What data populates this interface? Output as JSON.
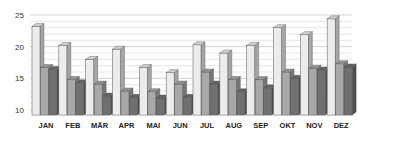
{
  "chart_data": {
    "type": "bar",
    "style": "3d-clustered-column",
    "title": "",
    "xlabel": "",
    "ylabel": "",
    "ylim": [
      9.2,
      25.5
    ],
    "yticks": [
      10,
      15,
      20,
      25
    ],
    "grid": true,
    "minor_grid_step": 1,
    "legend": null,
    "categories": [
      "JAN",
      "FEB",
      "MÄR",
      "APR",
      "MAI",
      "JUN",
      "JUL",
      "AUG",
      "SEP",
      "OKT",
      "NOV",
      "DEZ"
    ],
    "series": [
      {
        "name": "Series 1",
        "color": "#ececec",
        "values": [
          23.2,
          20.2,
          18.0,
          19.6,
          16.7,
          15.9,
          20.3,
          19.0,
          20.2,
          23.0,
          21.9,
          24.4
        ]
      },
      {
        "name": "Series 2",
        "color": "#a8a8a8",
        "values": [
          16.7,
          14.8,
          14.1,
          13.0,
          12.9,
          14.1,
          16.0,
          14.8,
          14.8,
          16.0,
          16.6,
          17.3
        ]
      },
      {
        "name": "Series 3",
        "color": "#707070",
        "values": [
          16.4,
          14.3,
          12.2,
          12.0,
          11.9,
          12.0,
          14.1,
          12.9,
          13.5,
          15.0,
          16.3,
          16.8
        ]
      }
    ]
  }
}
